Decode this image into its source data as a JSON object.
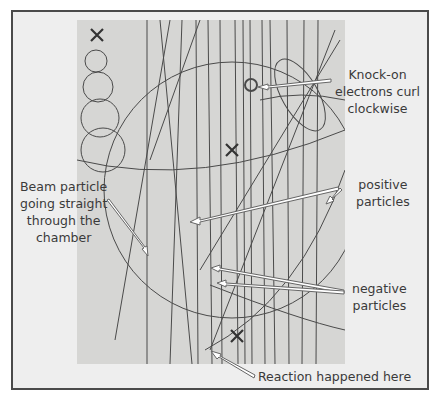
{
  "figure": {
    "type": "bubble chamber photograph with annotations",
    "colors": {
      "frame_border": "#4a4a4a",
      "frame_background": "#eeeeee",
      "photo_background": "#d6d6d4",
      "track_color": "#4a4a4a",
      "arrow_fill": "#ffffff",
      "arrow_stroke": "#666666",
      "label_color": "#3a3a3a"
    },
    "labels": {
      "knock_on": [
        "Knock-on",
        "electrons curl",
        "clockwise"
      ],
      "positive": [
        "positive",
        "particles"
      ],
      "beam": [
        "Beam particle",
        "going straight",
        "through the",
        "chamber"
      ],
      "negative": [
        "negative",
        "particles"
      ],
      "reaction": "Reaction happened here"
    },
    "markers": [
      "x-mark-top-left",
      "x-mark-center",
      "x-mark-bottom"
    ]
  }
}
